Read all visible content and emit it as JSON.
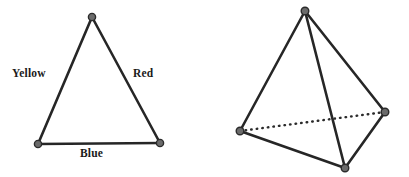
{
  "figure": {
    "background_color": "#ffffff",
    "stroke_color": "#262626",
    "vertex_fill_color": "#6b6b6b",
    "vertex_stroke_color": "#2b2b2b",
    "dotted_edge_color": "#2b2b2b"
  },
  "triangle": {
    "name": "labeled-triangle",
    "vertices": [
      {
        "id": "apex",
        "x": 92,
        "y": 17
      },
      {
        "id": "bottom-left",
        "x": 38,
        "y": 144
      },
      {
        "id": "bottom-right",
        "x": 160,
        "y": 143
      }
    ],
    "edges": [
      {
        "id": "left-edge",
        "from": "apex",
        "to": "bottom-left",
        "label": "Yellow",
        "style": "solid"
      },
      {
        "id": "right-edge",
        "from": "apex",
        "to": "bottom-right",
        "label": "Red",
        "style": "solid"
      },
      {
        "id": "bottom-edge",
        "from": "bottom-left",
        "to": "bottom-right",
        "label": "Blue",
        "style": "solid"
      }
    ],
    "labels": {
      "yellow": "Yellow",
      "red": "Red",
      "blue": "Blue"
    }
  },
  "tetrahedron": {
    "name": "tetrahedron",
    "vertices": [
      {
        "id": "apex",
        "x": 305,
        "y": 11
      },
      {
        "id": "left",
        "x": 240,
        "y": 131
      },
      {
        "id": "right",
        "x": 385,
        "y": 112
      },
      {
        "id": "bottom",
        "x": 345,
        "y": 168
      }
    ],
    "edges": [
      {
        "id": "apex-left",
        "from": "apex",
        "to": "left",
        "style": "solid"
      },
      {
        "id": "apex-right",
        "from": "apex",
        "to": "right",
        "style": "solid"
      },
      {
        "id": "apex-bottom",
        "from": "apex",
        "to": "bottom",
        "style": "solid"
      },
      {
        "id": "left-bottom",
        "from": "left",
        "to": "bottom",
        "style": "solid"
      },
      {
        "id": "right-bottom",
        "from": "right",
        "to": "bottom",
        "style": "solid"
      },
      {
        "id": "left-right-hidden",
        "from": "left",
        "to": "right",
        "style": "dotted"
      }
    ]
  }
}
